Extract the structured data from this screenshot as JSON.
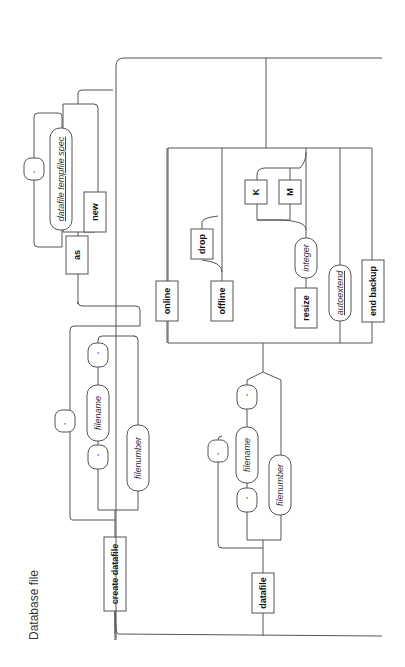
{
  "title": "Database file",
  "orientation": "rotated-90-ccw",
  "diagram_type": "railroad-syntax-diagram",
  "create_branch": {
    "keyword": "create datafile",
    "file_spec": {
      "open_quote": "'",
      "name": "filename",
      "close_quote": "'",
      "number": "filenumber",
      "separator": ","
    },
    "as_keyword": "as",
    "as_options": {
      "spec": "datafile tempfile spec",
      "separator": ",",
      "new": "new"
    }
  },
  "alter_branch": {
    "keyword": "datafile",
    "file_spec": {
      "open_quote": "'",
      "name": "filename",
      "close_quote": "'",
      "number": "filenumber",
      "separator": ","
    },
    "options": {
      "online": "online",
      "offline": "offline",
      "drop": "drop",
      "resize": "resize",
      "integer": "integer",
      "unit_k": "K",
      "unit_m": "M",
      "autoextend": "autoextend",
      "end_backup": "end backup"
    }
  }
}
